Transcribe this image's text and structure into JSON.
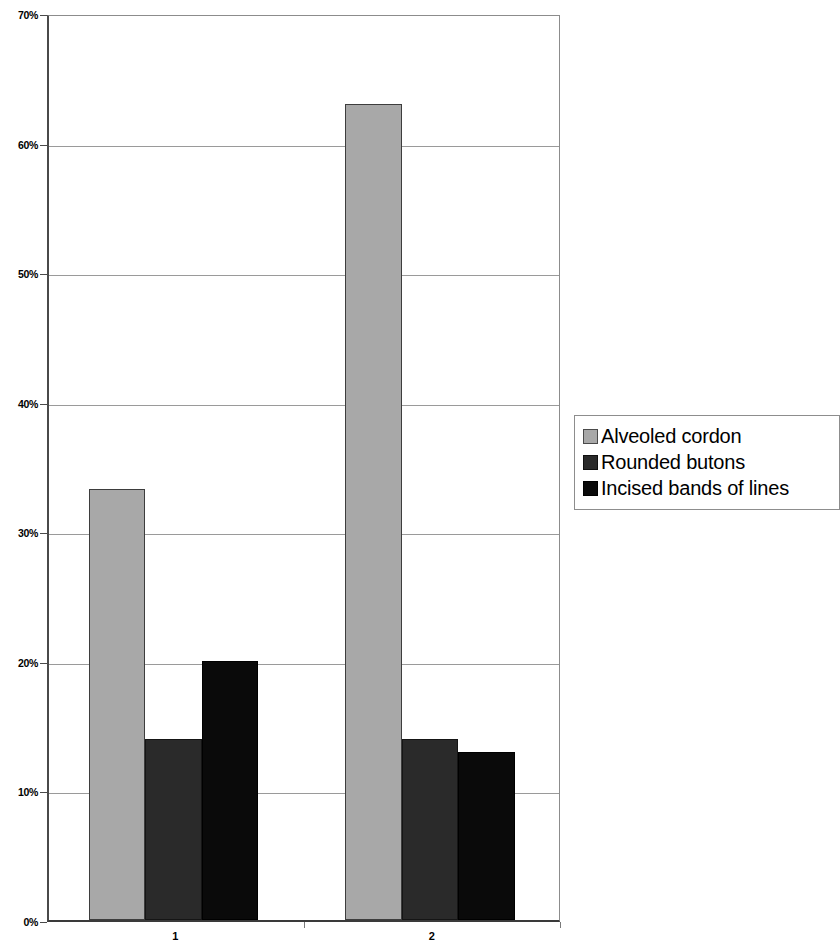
{
  "chart_data": {
    "type": "bar",
    "title": "",
    "subtitle": "",
    "xlabel": "",
    "ylabel": "",
    "categories": [
      "1",
      "2"
    ],
    "series": [
      {
        "name": "Alveoled cordon",
        "color": "#a8a8a8",
        "values": [
          33.3,
          63
        ]
      },
      {
        "name": "Rounded butons",
        "color": "#2a2a2a",
        "values": [
          14,
          14
        ]
      },
      {
        "name": "Incised bands of lines",
        "color": "#0a0a0a",
        "values": [
          13.9,
          13
        ]
      }
    ],
    "ylim": [
      0,
      70
    ],
    "ytick_values": [
      0,
      10,
      20,
      30,
      40,
      50,
      60,
      70
    ],
    "ytick_labels": [
      "0%",
      "10%",
      "20%",
      "30%",
      "40%",
      "50%",
      "60%",
      "70%"
    ],
    "grid": true,
    "grid_axis": "y",
    "legend_position": "right",
    "annotations": []
  },
  "chart_overrides": {
    "series_0_values": [
      33.3,
      63
    ],
    "series_1_values": [
      14,
      14
    ],
    "series_2_values": [
      20,
      13
    ]
  },
  "axes": {
    "y_axis_name": "percentage-axis",
    "x_axis_name": "category-axis"
  }
}
